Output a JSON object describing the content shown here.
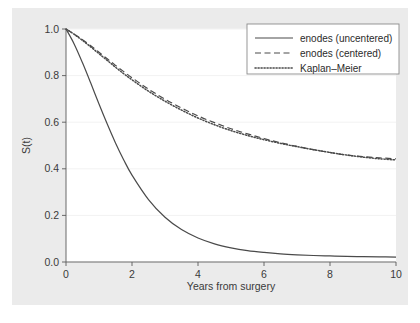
{
  "figure": {
    "name": "survival-curve-figure",
    "background_color": "#ffffff",
    "graph_region_color": "#ebebeb",
    "plot_area_color": "#ffffff"
  },
  "chart_data": {
    "type": "line",
    "title": "",
    "subtitle": "",
    "xlabel": "Years from surgery",
    "ylabel": "S(t)",
    "xlim": [
      0,
      10
    ],
    "ylim": [
      0,
      1.0
    ],
    "xticks": [
      0,
      2,
      4,
      6,
      8,
      10
    ],
    "xticklabels": [
      "0",
      "2",
      "4",
      "6",
      "8",
      "10"
    ],
    "yticks": [
      0.0,
      0.2,
      0.4,
      0.6,
      0.8,
      1.0
    ],
    "yticklabels": [
      "0.0",
      "0.2",
      "0.4",
      "0.6",
      "0.8",
      "1.0"
    ],
    "grid": "horizontal",
    "grid_color": "#f2f2f2",
    "legend_position": "top-right",
    "line_color": "#4a4a4a",
    "x": [
      0,
      0.25,
      0.5,
      0.75,
      1,
      1.25,
      1.5,
      1.75,
      2,
      2.5,
      3,
      3.5,
      4,
      4.5,
      5,
      5.5,
      6,
      6.5,
      7,
      7.5,
      8,
      8.5,
      9,
      9.5,
      10
    ],
    "series": [
      {
        "name": "enodes (uncentered)",
        "dash": "solid",
        "values": [
          1.0,
          0.935,
          0.855,
          0.768,
          0.678,
          0.592,
          0.511,
          0.438,
          0.373,
          0.268,
          0.192,
          0.139,
          0.103,
          0.078,
          0.061,
          0.049,
          0.041,
          0.035,
          0.031,
          0.028,
          0.026,
          0.024,
          0.023,
          0.022,
          0.021
        ]
      },
      {
        "name": "enodes (centered)",
        "dash": "dashed",
        "values": [
          1.0,
          0.978,
          0.954,
          0.928,
          0.9,
          0.872,
          0.844,
          0.817,
          0.791,
          0.742,
          0.699,
          0.661,
          0.627,
          0.598,
          0.572,
          0.55,
          0.53,
          0.512,
          0.496,
          0.482,
          0.47,
          0.459,
          0.452,
          0.447,
          0.443
        ]
      },
      {
        "name": "Kaplan–Meier",
        "dash": "dotted",
        "values": [
          1.0,
          0.977,
          0.951,
          0.923,
          0.894,
          0.865,
          0.836,
          0.808,
          0.782,
          0.733,
          0.69,
          0.652,
          0.618,
          0.589,
          0.564,
          0.543,
          0.525,
          0.509,
          0.495,
          0.482,
          0.47,
          0.459,
          0.45,
          0.443,
          0.438
        ]
      }
    ]
  },
  "legend": {
    "items": [
      {
        "label": "enodes (uncentered)",
        "dash": "solid"
      },
      {
        "label": "enodes (centered)",
        "dash": "dashed"
      },
      {
        "label": "Kaplan–Meier",
        "dash": "dotted"
      }
    ]
  }
}
